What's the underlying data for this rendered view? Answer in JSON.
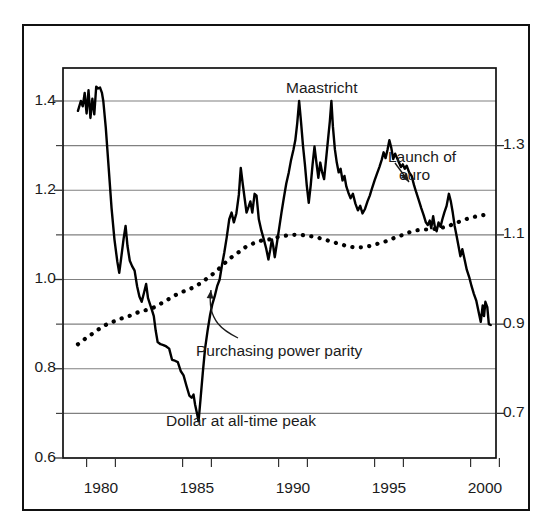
{
  "chart_data": {
    "type": "line",
    "title": "",
    "subtitle": "",
    "xlabel": "",
    "ylabel": "",
    "xlim": [
      1978.6,
      2000.9
    ],
    "ylim": [
      0.6,
      1.46
    ],
    "grid": true,
    "legend_position": "none",
    "axes": {
      "left": {
        "major_ticks": [
          "1.4",
          "1.2",
          "1.0",
          "0.8",
          "0.6"
        ],
        "major_values": [
          1.4,
          1.2,
          1.0,
          0.8,
          0.6
        ],
        "minor_values": [
          1.3,
          1.1,
          0.9,
          0.7
        ]
      },
      "right": {
        "major_ticks": [
          "1.3",
          "1.1",
          "0.9",
          "0.7"
        ],
        "major_values": [
          1.3,
          1.1,
          0.9,
          0.7
        ]
      },
      "x": {
        "tick_labels": [
          "1980",
          "1985",
          "1990",
          "1995",
          "2000"
        ],
        "tick_values": [
          1980,
          1985,
          1990,
          1995,
          2000
        ]
      }
    },
    "annotations": [
      {
        "id": "maastricht",
        "text": "Maastricht",
        "x": 1991.2,
        "y": 1.435,
        "arrow": false
      },
      {
        "id": "launch-of-euro",
        "text": "Launch of euro",
        "line1": "Launch of",
        "line2": "euro",
        "x": 1997.6,
        "y": 1.305,
        "arrow": true
      },
      {
        "id": "purchasing-power-parity",
        "text": "Purchasing power parity",
        "x": 1988.0,
        "y": 0.845,
        "arrow": true
      },
      {
        "id": "dollar-at-all-time-peak",
        "text": "Dollar at all-time peak",
        "x": 1985.6,
        "y": 0.672,
        "arrow": false
      }
    ],
    "series": [
      {
        "name": "Exchange rate",
        "style": "solid",
        "color": "#000000",
        "points": [
          [
            1978.8,
            1.378
          ],
          [
            1978.95,
            1.4
          ],
          [
            1979.05,
            1.388
          ],
          [
            1979.15,
            1.418
          ],
          [
            1979.25,
            1.372
          ],
          [
            1979.35,
            1.424
          ],
          [
            1979.45,
            1.362
          ],
          [
            1979.55,
            1.405
          ],
          [
            1979.65,
            1.37
          ],
          [
            1979.75,
            1.432
          ],
          [
            1979.85,
            1.428
          ],
          [
            1979.95,
            1.43
          ],
          [
            1980.05,
            1.418
          ],
          [
            1980.12,
            1.4
          ],
          [
            1980.25,
            1.34
          ],
          [
            1980.4,
            1.25
          ],
          [
            1980.55,
            1.16
          ],
          [
            1980.7,
            1.09
          ],
          [
            1980.85,
            1.04
          ],
          [
            1980.95,
            1.015
          ],
          [
            1981.05,
            1.048
          ],
          [
            1981.18,
            1.092
          ],
          [
            1981.28,
            1.12
          ],
          [
            1981.38,
            1.075
          ],
          [
            1981.5,
            1.042
          ],
          [
            1981.62,
            1.03
          ],
          [
            1981.75,
            1.02
          ],
          [
            1981.88,
            0.985
          ],
          [
            1982.0,
            0.962
          ],
          [
            1982.12,
            0.95
          ],
          [
            1982.25,
            0.972
          ],
          [
            1982.35,
            0.99
          ],
          [
            1982.45,
            0.958
          ],
          [
            1982.55,
            0.945
          ],
          [
            1982.65,
            0.932
          ],
          [
            1982.75,
            0.918
          ],
          [
            1982.85,
            0.885
          ],
          [
            1982.95,
            0.86
          ],
          [
            1983.1,
            0.855
          ],
          [
            1983.25,
            0.853
          ],
          [
            1983.4,
            0.85
          ],
          [
            1983.55,
            0.845
          ],
          [
            1983.7,
            0.82
          ],
          [
            1983.85,
            0.818
          ],
          [
            1984.0,
            0.815
          ],
          [
            1984.15,
            0.795
          ],
          [
            1984.3,
            0.785
          ],
          [
            1984.45,
            0.762
          ],
          [
            1984.6,
            0.74
          ],
          [
            1984.72,
            0.735
          ],
          [
            1984.82,
            0.742
          ],
          [
            1984.9,
            0.72
          ],
          [
            1985.0,
            0.7
          ],
          [
            1985.08,
            0.682
          ],
          [
            1985.18,
            0.73
          ],
          [
            1985.3,
            0.79
          ],
          [
            1985.42,
            0.845
          ],
          [
            1985.55,
            0.885
          ],
          [
            1985.68,
            0.92
          ],
          [
            1985.8,
            0.945
          ],
          [
            1985.92,
            0.962
          ],
          [
            1986.05,
            0.985
          ],
          [
            1986.18,
            1.0
          ],
          [
            1986.3,
            1.032
          ],
          [
            1986.42,
            1.06
          ],
          [
            1986.55,
            1.095
          ],
          [
            1986.68,
            1.135
          ],
          [
            1986.8,
            1.15
          ],
          [
            1986.92,
            1.128
          ],
          [
            1987.05,
            1.148
          ],
          [
            1987.18,
            1.19
          ],
          [
            1987.28,
            1.25
          ],
          [
            1987.38,
            1.215
          ],
          [
            1987.48,
            1.182
          ],
          [
            1987.58,
            1.15
          ],
          [
            1987.68,
            1.162
          ],
          [
            1987.78,
            1.175
          ],
          [
            1987.88,
            1.15
          ],
          [
            1988.0,
            1.192
          ],
          [
            1988.1,
            1.188
          ],
          [
            1988.22,
            1.135
          ],
          [
            1988.35,
            1.11
          ],
          [
            1988.48,
            1.09
          ],
          [
            1988.6,
            1.07
          ],
          [
            1988.72,
            1.045
          ],
          [
            1988.82,
            1.068
          ],
          [
            1988.9,
            1.09
          ],
          [
            1988.97,
            1.075
          ],
          [
            1989.05,
            1.05
          ],
          [
            1989.15,
            1.078
          ],
          [
            1989.28,
            1.115
          ],
          [
            1989.4,
            1.15
          ],
          [
            1989.52,
            1.182
          ],
          [
            1989.65,
            1.215
          ],
          [
            1989.78,
            1.24
          ],
          [
            1989.9,
            1.268
          ],
          [
            1990.02,
            1.29
          ],
          [
            1990.12,
            1.312
          ],
          [
            1990.22,
            1.35
          ],
          [
            1990.32,
            1.4
          ],
          [
            1990.42,
            1.352
          ],
          [
            1990.52,
            1.3
          ],
          [
            1990.62,
            1.258
          ],
          [
            1990.72,
            1.21
          ],
          [
            1990.82,
            1.172
          ],
          [
            1990.92,
            1.21
          ],
          [
            1991.02,
            1.258
          ],
          [
            1991.12,
            1.298
          ],
          [
            1991.22,
            1.262
          ],
          [
            1991.32,
            1.228
          ],
          [
            1991.42,
            1.262
          ],
          [
            1991.52,
            1.24
          ],
          [
            1991.62,
            1.225
          ],
          [
            1991.72,
            1.268
          ],
          [
            1991.82,
            1.312
          ],
          [
            1991.92,
            1.355
          ],
          [
            1992.0,
            1.4
          ],
          [
            1992.08,
            1.342
          ],
          [
            1992.18,
            1.292
          ],
          [
            1992.28,
            1.262
          ],
          [
            1992.38,
            1.24
          ],
          [
            1992.48,
            1.248
          ],
          [
            1992.58,
            1.222
          ],
          [
            1992.68,
            1.232
          ],
          [
            1992.78,
            1.208
          ],
          [
            1992.88,
            1.195
          ],
          [
            1993.0,
            1.182
          ],
          [
            1993.12,
            1.192
          ],
          [
            1993.25,
            1.17
          ],
          [
            1993.38,
            1.155
          ],
          [
            1993.5,
            1.165
          ],
          [
            1993.62,
            1.148
          ],
          [
            1993.75,
            1.158
          ],
          [
            1993.88,
            1.175
          ],
          [
            1994.0,
            1.188
          ],
          [
            1994.12,
            1.205
          ],
          [
            1994.25,
            1.222
          ],
          [
            1994.38,
            1.238
          ],
          [
            1994.5,
            1.252
          ],
          [
            1994.62,
            1.268
          ],
          [
            1994.72,
            1.285
          ],
          [
            1994.82,
            1.272
          ],
          [
            1994.92,
            1.29
          ],
          [
            1995.02,
            1.312
          ],
          [
            1995.12,
            1.295
          ],
          [
            1995.22,
            1.27
          ],
          [
            1995.32,
            1.282
          ],
          [
            1995.42,
            1.272
          ],
          [
            1995.52,
            1.262
          ],
          [
            1995.62,
            1.252
          ],
          [
            1995.72,
            1.258
          ],
          [
            1995.82,
            1.248
          ],
          [
            1995.92,
            1.255
          ],
          [
            1996.05,
            1.24
          ],
          [
            1996.18,
            1.232
          ],
          [
            1996.3,
            1.212
          ],
          [
            1996.42,
            1.195
          ],
          [
            1996.55,
            1.178
          ],
          [
            1996.68,
            1.16
          ],
          [
            1996.8,
            1.145
          ],
          [
            1996.92,
            1.128
          ],
          [
            1997.02,
            1.122
          ],
          [
            1997.12,
            1.132
          ],
          [
            1997.2,
            1.115
          ],
          [
            1997.3,
            1.142
          ],
          [
            1997.38,
            1.12
          ],
          [
            1997.48,
            1.108
          ],
          [
            1997.58,
            1.128
          ],
          [
            1997.68,
            1.118
          ],
          [
            1997.78,
            1.135
          ],
          [
            1997.88,
            1.15
          ],
          [
            1998.0,
            1.165
          ],
          [
            1998.12,
            1.192
          ],
          [
            1998.22,
            1.175
          ],
          [
            1998.32,
            1.15
          ],
          [
            1998.42,
            1.12
          ],
          [
            1998.52,
            1.098
          ],
          [
            1998.62,
            1.075
          ],
          [
            1998.72,
            1.052
          ],
          [
            1998.82,
            1.068
          ],
          [
            1998.92,
            1.048
          ],
          [
            1999.05,
            1.022
          ],
          [
            1999.18,
            1.005
          ],
          [
            1999.3,
            0.985
          ],
          [
            1999.42,
            0.968
          ],
          [
            1999.55,
            0.952
          ],
          [
            1999.68,
            0.925
          ],
          [
            1999.78,
            0.905
          ],
          [
            1999.88,
            0.942
          ],
          [
            1999.95,
            0.918
          ],
          [
            2000.02,
            0.95
          ],
          [
            2000.12,
            0.938
          ],
          [
            2000.2,
            0.9
          ],
          [
            2000.3,
            0.898
          ]
        ]
      },
      {
        "name": "Purchasing power parity",
        "style": "dotted",
        "color": "#000000",
        "points": [
          [
            1978.8,
            0.855
          ],
          [
            1979.2,
            0.868
          ],
          [
            1979.6,
            0.88
          ],
          [
            1980.0,
            0.892
          ],
          [
            1980.4,
            0.902
          ],
          [
            1980.8,
            0.908
          ],
          [
            1981.2,
            0.915
          ],
          [
            1981.6,
            0.92
          ],
          [
            1982.0,
            0.928
          ],
          [
            1982.4,
            0.932
          ],
          [
            1982.8,
            0.938
          ],
          [
            1983.2,
            0.948
          ],
          [
            1983.6,
            0.958
          ],
          [
            1984.0,
            0.968
          ],
          [
            1984.4,
            0.975
          ],
          [
            1984.8,
            0.982
          ],
          [
            1985.2,
            0.992
          ],
          [
            1985.6,
            1.005
          ],
          [
            1986.0,
            1.018
          ],
          [
            1986.4,
            1.035
          ],
          [
            1986.8,
            1.05
          ],
          [
            1987.2,
            1.062
          ],
          [
            1987.6,
            1.075
          ],
          [
            1988.0,
            1.082
          ],
          [
            1988.4,
            1.088
          ],
          [
            1988.8,
            1.09
          ],
          [
            1989.2,
            1.095
          ],
          [
            1989.6,
            1.098
          ],
          [
            1990.0,
            1.1
          ],
          [
            1990.4,
            1.1
          ],
          [
            1990.8,
            1.098
          ],
          [
            1991.2,
            1.095
          ],
          [
            1991.6,
            1.09
          ],
          [
            1992.0,
            1.085
          ],
          [
            1992.4,
            1.08
          ],
          [
            1992.8,
            1.075
          ],
          [
            1993.2,
            1.072
          ],
          [
            1993.6,
            1.072
          ],
          [
            1994.0,
            1.075
          ],
          [
            1994.4,
            1.08
          ],
          [
            1994.8,
            1.085
          ],
          [
            1995.2,
            1.092
          ],
          [
            1995.6,
            1.098
          ],
          [
            1996.0,
            1.105
          ],
          [
            1996.4,
            1.11
          ],
          [
            1996.8,
            1.112
          ],
          [
            1997.2,
            1.112
          ],
          [
            1997.6,
            1.115
          ],
          [
            1998.0,
            1.118
          ],
          [
            1998.4,
            1.125
          ],
          [
            1998.8,
            1.132
          ],
          [
            1999.2,
            1.138
          ],
          [
            1999.6,
            1.142
          ],
          [
            2000.0,
            1.145
          ]
        ]
      }
    ]
  },
  "annotation_text": {
    "maastricht": "Maastricht",
    "launch_line1": "Launch of",
    "launch_line2": "euro",
    "ppp": "Purchasing power parity",
    "dollar_peak": "Dollar at all-time peak"
  },
  "y_left": {
    "t0": "1.4",
    "t1": "1.2",
    "t2": "1.0",
    "t3": "0.8",
    "t4": "0.6"
  },
  "y_right": {
    "t0": "1.3",
    "t1": "1.1",
    "t2": "0.9",
    "t3": "0.7"
  },
  "x_axis": {
    "t0": "1980",
    "t1": "1985",
    "t2": "1990",
    "t3": "1995",
    "t4": "2000"
  },
  "colors": {
    "line": "#000000",
    "grid": "#808080",
    "frame": "#111111",
    "text": "#1b1b1b",
    "background": "#ffffff"
  }
}
